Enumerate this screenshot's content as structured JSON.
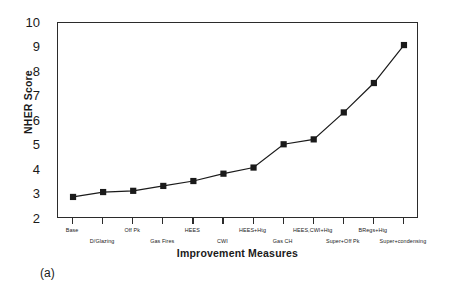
{
  "caption": "(a)",
  "chart_data": {
    "type": "line",
    "title": "",
    "xlabel": "Improvement Measures",
    "ylabel": "NHER Score",
    "ylim": [
      2,
      10
    ],
    "yticks": [
      2,
      3,
      4,
      5,
      6,
      7,
      8,
      9,
      10
    ],
    "grid": false,
    "legend": "none",
    "marker": "filled-square",
    "line_color": "#1a1a1a",
    "marker_color": "#1a1a1a",
    "categories": [
      "Base",
      "D/Glazing",
      "Off Pk",
      "Gas Fires",
      "HEES",
      "CWI",
      "HEES+Htg",
      "Gas CH",
      "HEES,CWI+Htg",
      "Super+Off Pk",
      "BRegs+Htg",
      "Super+condensing"
    ],
    "values": [
      2.9,
      3.1,
      3.15,
      3.35,
      3.55,
      3.85,
      4.1,
      5.05,
      5.25,
      6.35,
      7.55,
      9.1
    ],
    "series": [
      {
        "name": "NHER Score",
        "values": [
          2.9,
          3.1,
          3.15,
          3.35,
          3.55,
          3.85,
          4.1,
          5.05,
          5.25,
          6.35,
          7.55,
          9.1
        ]
      }
    ]
  }
}
